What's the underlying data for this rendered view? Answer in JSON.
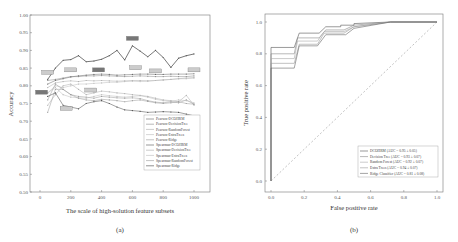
{
  "chart_data": [
    {
      "type": "line",
      "panel_label": "(a)",
      "xlabel": "The scale of  high-solution feature subsets",
      "ylabel": "Accuracy",
      "xlim": [
        -20,
        1060
      ],
      "ylim": [
        0.5,
        1.0
      ],
      "xticks": [
        "0",
        "200",
        "400",
        "600",
        "800",
        "1000"
      ],
      "yticks": [
        "0.50",
        "0.55",
        "0.60",
        "0.65",
        "0.70",
        "0.75",
        "0.80",
        "0.85",
        "0.90",
        "0.95",
        "1.00"
      ],
      "legend_position": "lower right (inside)",
      "x": [
        50,
        100,
        150,
        200,
        250,
        300,
        350,
        400,
        450,
        500,
        550,
        600,
        650,
        700,
        750,
        800,
        850,
        900,
        950,
        1000
      ],
      "series": [
        {
          "name": "Pearson-DCOHRM",
          "values": [
            0.805,
            0.815,
            0.82,
            0.825,
            0.828,
            0.83,
            0.832,
            0.833,
            0.832,
            0.83,
            0.831,
            0.832,
            0.833,
            0.833,
            0.832,
            0.832,
            0.833,
            0.833,
            0.833,
            0.834
          ]
        },
        {
          "name": "Pearson-DecisionTree",
          "values": [
            0.815,
            0.818,
            0.822,
            0.826,
            0.826,
            0.828,
            0.828,
            0.829,
            0.828,
            0.827,
            0.826,
            0.827,
            0.828,
            0.827,
            0.826,
            0.826,
            0.827,
            0.826,
            0.826,
            0.828
          ]
        },
        {
          "name": "Pearson-RandomForest",
          "values": [
            0.795,
            0.808,
            0.812,
            0.814,
            0.812,
            0.815,
            0.814,
            0.815,
            0.814,
            0.813,
            0.814,
            0.815,
            0.815,
            0.814,
            0.815,
            0.817,
            0.818,
            0.82,
            0.822,
            0.823
          ]
        },
        {
          "name": "Pearson-ExtraTrees",
          "values": [
            0.78,
            0.8,
            0.795,
            0.8,
            0.805,
            0.805,
            0.807,
            0.808,
            0.81,
            0.81,
            0.812,
            0.813,
            0.812,
            0.813,
            0.815,
            0.816,
            0.818,
            0.82,
            0.82,
            0.822
          ]
        },
        {
          "name": "Pearson-Ridge",
          "values": [
            0.725,
            0.79,
            0.79,
            0.775,
            0.77,
            0.768,
            0.765,
            0.77,
            0.768,
            0.766,
            0.765,
            0.766,
            0.764,
            0.758,
            0.754,
            0.752,
            0.755,
            0.752,
            0.76,
            0.748
          ]
        },
        {
          "name": "Spearman-DCOHRM",
          "values": [
            0.818,
            0.85,
            0.872,
            0.874,
            0.885,
            0.868,
            0.87,
            0.875,
            0.885,
            0.9,
            0.873,
            0.913,
            0.898,
            0.882,
            0.9,
            0.88,
            0.852,
            0.878,
            0.885,
            0.89
          ]
        },
        {
          "name": "Spearman-DecisionTree",
          "values": [
            0.745,
            0.775,
            0.8,
            0.805,
            0.79,
            0.775,
            0.78,
            0.785,
            0.783,
            0.78,
            0.778,
            0.775,
            0.773,
            0.77,
            0.765,
            0.76,
            0.758,
            0.755,
            0.773,
            0.745
          ]
        },
        {
          "name": "Spearman-ExtraTrees",
          "values": [
            0.78,
            0.795,
            0.775,
            0.768,
            0.766,
            0.765,
            0.77,
            0.775,
            0.772,
            0.77,
            0.768,
            0.77,
            0.772,
            0.768,
            0.762,
            0.758,
            0.756,
            0.76,
            0.758,
            0.752
          ]
        },
        {
          "name": "Spearman-RandomForest",
          "values": [
            0.76,
            0.805,
            0.79,
            0.775,
            0.765,
            0.76,
            0.758,
            0.762,
            0.76,
            0.758,
            0.755,
            0.758,
            0.76,
            0.756,
            0.752,
            0.75,
            0.752,
            0.755,
            0.75,
            0.748
          ]
        },
        {
          "name": "Spearman-Ridge",
          "values": [
            0.77,
            0.78,
            0.745,
            0.74,
            0.735,
            0.75,
            0.755,
            0.758,
            0.75,
            0.74,
            0.732,
            0.73,
            0.728,
            0.725,
            0.726,
            0.727,
            0.726,
            0.725,
            0.72,
            0.715
          ]
        }
      ],
      "annotations": [
        {
          "x": 50,
          "y": 0.838,
          "style": "light"
        },
        {
          "x": 10,
          "y": 0.782,
          "style": "dark"
        },
        {
          "x": 200,
          "y": 0.845,
          "style": "light"
        },
        {
          "x": 170,
          "y": 0.736,
          "style": "light"
        },
        {
          "x": 330,
          "y": 0.788,
          "style": "light"
        },
        {
          "x": 380,
          "y": 0.845,
          "style": "dark"
        },
        {
          "x": 600,
          "y": 0.934,
          "style": "dark"
        },
        {
          "x": 620,
          "y": 0.851,
          "style": "light"
        },
        {
          "x": 750,
          "y": 0.842,
          "style": "light"
        },
        {
          "x": 1000,
          "y": 0.845,
          "style": "light"
        }
      ]
    },
    {
      "type": "line",
      "subtype": "roc",
      "panel_label": "(b)",
      "xlabel": "False positive rate",
      "ylabel": "True positive rate",
      "xlim": [
        -0.05,
        1.05
      ],
      "ylim": [
        -0.05,
        1.05
      ],
      "xticks": [
        "0.0",
        "0.2",
        "0.4",
        "0.6",
        "0.8",
        "1.0"
      ],
      "yticks": [
        "0.0",
        "0.2",
        "0.4",
        "0.6",
        "0.8",
        "1.0"
      ],
      "legend_position": "lower right",
      "diagonal": "dashed chance line from (0,0) to (1,1)",
      "series": [
        {
          "name": "DCOHRM (AUC = 0.95 ± 0.05)",
          "points": [
            [
              0,
              0
            ],
            [
              0,
              0.84
            ],
            [
              0.14,
              0.84
            ],
            [
              0.17,
              0.93
            ],
            [
              0.29,
              0.93
            ],
            [
              0.33,
              0.97
            ],
            [
              0.42,
              0.97
            ],
            [
              0.42,
              0.98
            ],
            [
              0.5,
              0.98
            ],
            [
              0.5,
              0.99
            ],
            [
              0.72,
              1.0
            ],
            [
              1,
              1
            ]
          ]
        },
        {
          "name": "Decision Tree (AUC = 0.93 ± 0.07)",
          "points": [
            [
              0,
              0
            ],
            [
              0,
              0.8
            ],
            [
              0.14,
              0.8
            ],
            [
              0.16,
              0.9
            ],
            [
              0.29,
              0.9
            ],
            [
              0.33,
              0.95
            ],
            [
              0.44,
              0.95
            ],
            [
              0.5,
              0.98
            ],
            [
              0.72,
              1.0
            ],
            [
              1,
              1
            ]
          ]
        },
        {
          "name": "Random Forest (AUC = 0.92 ± 0.07)",
          "points": [
            [
              0,
              0
            ],
            [
              0,
              0.77
            ],
            [
              0.14,
              0.77
            ],
            [
              0.16,
              0.88
            ],
            [
              0.28,
              0.88
            ],
            [
              0.32,
              0.94
            ],
            [
              0.44,
              0.94
            ],
            [
              0.5,
              0.97
            ],
            [
              0.72,
              1.0
            ],
            [
              1,
              1
            ]
          ]
        },
        {
          "name": "Extra Trees (AUC = 0.94 ± 0.07)",
          "points": [
            [
              0,
              0
            ],
            [
              0,
              0.74
            ],
            [
              0.14,
              0.74
            ],
            [
              0.17,
              0.86
            ],
            [
              0.28,
              0.86
            ],
            [
              0.32,
              0.93
            ],
            [
              0.44,
              0.93
            ],
            [
              0.5,
              0.97
            ],
            [
              0.72,
              1.0
            ],
            [
              1,
              1
            ]
          ]
        },
        {
          "name": "Ridge Classifier (AUC = 0.81 ± 0.08)",
          "points": [
            [
              0,
              0
            ],
            [
              0,
              0.71
            ],
            [
              0.14,
              0.71
            ],
            [
              0.17,
              0.85
            ],
            [
              0.28,
              0.85
            ],
            [
              0.33,
              0.92
            ],
            [
              0.45,
              0.92
            ],
            [
              0.5,
              0.96
            ],
            [
              0.72,
              1.0
            ],
            [
              1,
              1
            ]
          ]
        }
      ]
    }
  ],
  "captions": {
    "a": "(a)",
    "b": "(b)"
  }
}
